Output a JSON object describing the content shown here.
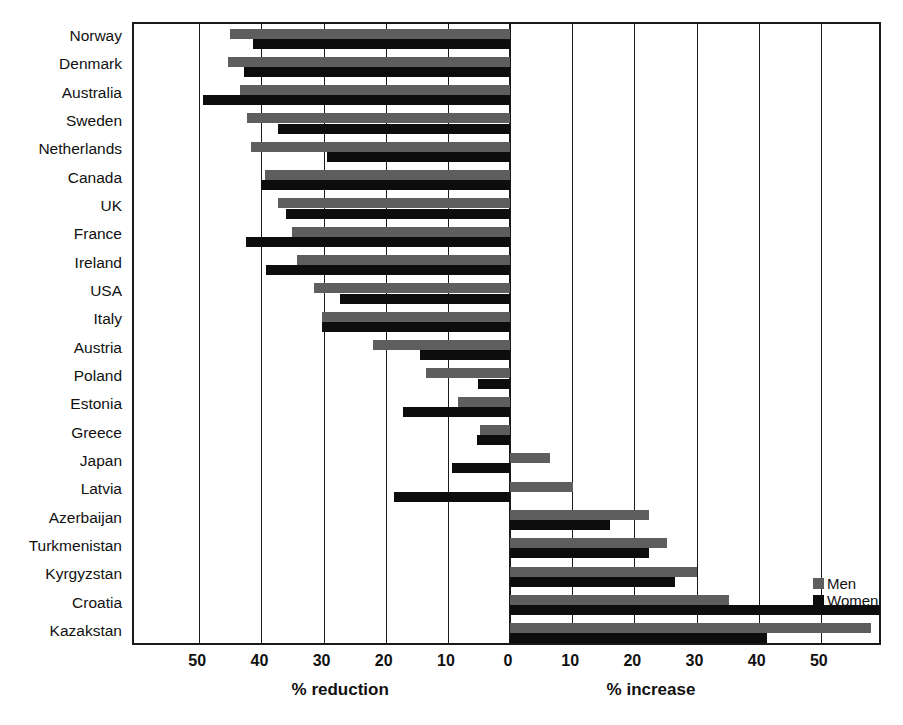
{
  "chart_data": {
    "type": "bar",
    "orientation": "horizontal",
    "title": "",
    "xlabel_left": "% reduction",
    "xlabel_right": "% increase",
    "ylabel": "",
    "grid": true,
    "legend_position": "right-lower",
    "xlim": [
      -60.5,
      60
    ],
    "xticks_left": [
      "50",
      "40",
      "30",
      "20",
      "10",
      "0"
    ],
    "xticks_right": [
      "10",
      "20",
      "30",
      "40",
      "50"
    ],
    "xtick_values": [
      -50,
      -40,
      -30,
      -20,
      -10,
      0,
      10,
      20,
      30,
      40,
      50
    ],
    "xtick_labels": [
      "50",
      "40",
      "30",
      "20",
      "10",
      "0",
      "10",
      "20",
      "30",
      "40",
      "50"
    ],
    "categories": [
      "Norway",
      "Denmark",
      "Australia",
      "Sweden",
      "Netherlands",
      "Canada",
      "UK",
      "France",
      "Ireland",
      "USA",
      "Italy",
      "Austria",
      "Poland",
      "Estonia",
      "Greece",
      "Japan",
      "Latvia",
      "Azerbaijan",
      "Turkmenistan",
      "Kyrgyzstan",
      "Croatia",
      "Kazakstan"
    ],
    "series": [
      {
        "name": "Men",
        "color": "#5e5e5e",
        "values": [
          -45.1,
          -45.3,
          -43.4,
          -42.4,
          -41.6,
          -39.4,
          -37.3,
          -35.1,
          -34.2,
          -31.6,
          -30.2,
          -22.0,
          -13.5,
          -8.4,
          -4.8,
          6.4,
          10.1,
          22.3,
          25.2,
          30.1,
          35.2,
          58.1
        ]
      },
      {
        "name": "Women",
        "color": "#0d0d0d",
        "values": [
          -41.3,
          -42.8,
          -49.4,
          -37.4,
          -29.5,
          -40.0,
          -36.1,
          -42.5,
          -39.2,
          -27.3,
          -30.2,
          -14.5,
          -5.1,
          -17.2,
          -5.3,
          -9.4,
          -18.7,
          16.1,
          22.3,
          26.6,
          59.5,
          41.4
        ]
      }
    ]
  },
  "legend": {
    "items": [
      {
        "label": "Men",
        "color": "#5e5e5e"
      },
      {
        "label": "Women",
        "color": "#0d0d0d"
      }
    ]
  }
}
